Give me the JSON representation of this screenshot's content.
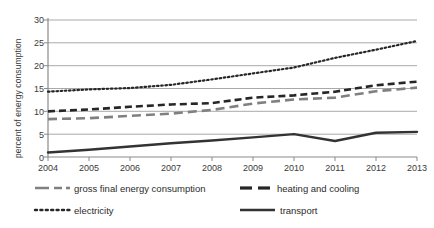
{
  "chart_data": {
    "type": "line",
    "title": "",
    "xlabel": "",
    "ylabel": "percent of energy consumption",
    "x": [
      2004,
      2005,
      2006,
      2007,
      2008,
      2009,
      2010,
      2011,
      2012,
      2013
    ],
    "xtick_labels": [
      "2004",
      "2005",
      "2006",
      "2007",
      "2008",
      "2009",
      "2010",
      "2011",
      "2012",
      "2013"
    ],
    "ytick_labels": [
      "0",
      "5",
      "10",
      "15",
      "20",
      "25",
      "30"
    ],
    "yticks": [
      0,
      5,
      10,
      15,
      20,
      25,
      30
    ],
    "ylim": [
      0,
      30
    ],
    "xlim": [
      2004,
      2013
    ],
    "grid": "horizontal",
    "legend_position": "bottom",
    "series": [
      {
        "name": "gross final energy consumption",
        "style": "long-dash",
        "color": "#808080",
        "values": [
          8.3,
          8.5,
          9.0,
          9.5,
          10.3,
          11.7,
          12.6,
          13.0,
          14.4,
          15.2
        ]
      },
      {
        "name": "heating and cooling",
        "style": "dash",
        "color": "#262626",
        "values": [
          10.0,
          10.4,
          11.0,
          11.5,
          11.8,
          13.0,
          13.5,
          14.3,
          15.7,
          16.5
        ]
      },
      {
        "name": "electricity",
        "style": "dotted",
        "color": "#262626",
        "values": [
          14.3,
          14.8,
          15.1,
          15.8,
          17.0,
          18.3,
          19.6,
          21.7,
          23.5,
          25.4
        ]
      },
      {
        "name": "transport",
        "style": "solid",
        "color": "#333333",
        "values": [
          1.0,
          1.6,
          2.3,
          3.0,
          3.6,
          4.3,
          5.0,
          3.5,
          5.3,
          5.5
        ]
      }
    ]
  },
  "legend": {
    "items": [
      {
        "label": "gross final energy consumption"
      },
      {
        "label": "heating and cooling"
      },
      {
        "label": "electricity"
      },
      {
        "label": "transport"
      }
    ]
  },
  "colors": {
    "gray_series": "#808080",
    "dark_series": "#262626",
    "grid": "#aaaaaa",
    "axis": "#777777",
    "text": "#2b2b2b"
  }
}
